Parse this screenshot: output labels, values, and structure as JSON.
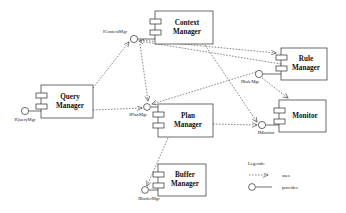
{
  "diagram": {
    "components": [
      {
        "id": "query-manager",
        "name": "Query\nManager",
        "line1": "Query",
        "line2": "Manager",
        "x": 41,
        "y": 85,
        "w": 52,
        "h": 33
      },
      {
        "id": "context-manager",
        "name": "Context\nManager",
        "line1": "Context",
        "line2": "Manager",
        "x": 155,
        "y": 11,
        "w": 58,
        "h": 33
      },
      {
        "id": "plan-manager",
        "name": "Plan\nManager",
        "line1": "Plan",
        "line2": "Manager",
        "x": 158,
        "y": 104,
        "w": 55,
        "h": 33
      },
      {
        "id": "buffer-manager",
        "name": "Buffer\nManager",
        "line1": "Buffer",
        "line2": "Manager",
        "x": 158,
        "y": 164,
        "w": 48,
        "h": 32
      },
      {
        "id": "rule-manager",
        "name": "Rule\nManager",
        "line1": "Rule",
        "line2": "Manager",
        "x": 281,
        "y": 48,
        "w": 46,
        "h": 32
      },
      {
        "id": "monitor",
        "name": "Monitor",
        "line1": "Monitor",
        "line2": "",
        "x": 279,
        "y": 100,
        "w": 47,
        "h": 32
      }
    ],
    "interfaces": [
      {
        "id": "iquerymgr",
        "label": "IQueryMgr",
        "cx": 25,
        "cy": 111,
        "label_x": 25,
        "label_y": 120
      },
      {
        "id": "icontextmgr",
        "label": "IContextMgr",
        "cx": 134,
        "cy": 39,
        "label_x": 117,
        "label_y": 32
      },
      {
        "id": "iplanmgr",
        "label": "IPlanMgr",
        "cx": 147,
        "cy": 107,
        "label_x": 138,
        "label_y": 115
      },
      {
        "id": "ibuffermgr",
        "label": "IBufferMgr",
        "cx": 145,
        "cy": 190,
        "label_x": 148,
        "label_y": 199
      },
      {
        "id": "irulemgr",
        "label": "IRuleMgr",
        "cx": 259,
        "cy": 74,
        "label_x": 252,
        "label_y": 82
      },
      {
        "id": "imonitor",
        "label": "IMonitor",
        "cx": 262,
        "cy": 125,
        "label_x": 265,
        "label_y": 133
      }
    ],
    "legend": {
      "title": "Legends:",
      "items": [
        {
          "id": "uses",
          "label": "uses",
          "symbol": "dashed-arrow"
        },
        {
          "id": "provides",
          "label": "provides",
          "symbol": "circle-line"
        }
      ]
    },
    "colors": {
      "stroke": "#2b2b2b",
      "dash": "#3a3a3a",
      "background": "#ffffff",
      "text": "#111111"
    }
  }
}
